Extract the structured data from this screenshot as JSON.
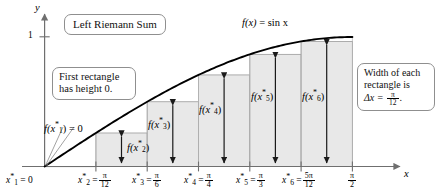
{
  "figure": {
    "title_callout": "Left Riemann Sum",
    "first_rect_callout_line1": "First rectangle",
    "first_rect_callout_line2": "has height 0.",
    "width_callout_line1": "Width of each",
    "width_callout_line2": "rectangle is",
    "width_callout_line3_lhs": "Δx =",
    "width_callout_frac_num": "π",
    "width_callout_frac_den": "12",
    "width_callout_period": ".",
    "function_label_fx": "f(x)",
    "function_label_eq": "=",
    "function_label_rhs": "sin x",
    "y_axis_label": "y",
    "x_axis_label": "x",
    "y_tick_label": "1",
    "f_x1_label_lhs": "f(x",
    "f_x1_label_star": "*",
    "f_x1_label_sub": "1",
    "f_x1_label_rhs": ") = 0",
    "height_arrow_labels": [
      {
        "lhs": "f(x",
        "sub": "2",
        "rhs": ")"
      },
      {
        "lhs": "f(x",
        "sub": "3",
        "rhs": ")"
      },
      {
        "lhs": "f(x",
        "sub": "4",
        "rhs": ")"
      },
      {
        "lhs": "f(x",
        "sub": "5",
        "rhs": ")"
      },
      {
        "lhs": "f(x",
        "sub": "6",
        "rhs": ")"
      }
    ],
    "x_tick_labels": [
      {
        "lhs": "x",
        "sub": "1",
        "eq": "= 0",
        "num": "",
        "den": ""
      },
      {
        "lhs": "x",
        "sub": "2",
        "eq": "=",
        "num": "π",
        "den": "12"
      },
      {
        "lhs": "x",
        "sub": "3",
        "eq": "=",
        "num": "π",
        "den": "6"
      },
      {
        "lhs": "x",
        "sub": "4",
        "eq": "=",
        "num": "π",
        "den": "4"
      },
      {
        "lhs": "x",
        "sub": "5",
        "eq": "=",
        "num": "π",
        "den": "3"
      },
      {
        "lhs": "x",
        "sub": "6",
        "eq": "=",
        "num": "5π",
        "den": "12"
      }
    ],
    "x_end_tick": {
      "num": "π",
      "den": "2"
    },
    "colors": {
      "rect_fill": "#e8e8e8",
      "rect_stroke": "#9a9a9a",
      "curve": "#000000",
      "axis": "#6f6f6f",
      "callout_border": "#8f8f8f",
      "arrow": "#1a1a1a"
    }
  },
  "chart_data": {
    "type": "area",
    "title": "Left Riemann Sum",
    "function": "f(x) = sin x",
    "xlabel": "x",
    "ylabel": "y",
    "xlim": [
      0,
      1.5708
    ],
    "ylim": [
      0,
      1.15
    ],
    "grid": false,
    "legend": "none",
    "delta_x": "pi/12",
    "n_rectangles": 6,
    "sample_points_labels": [
      "0",
      "pi/12",
      "pi/6",
      "pi/4",
      "pi/3",
      "5pi/12"
    ],
    "sample_points_values": [
      0.0,
      0.2618,
      0.5236,
      0.7854,
      1.0472,
      1.309
    ],
    "rectangle_heights_labels": [
      "f(x1*) = 0",
      "f(x2*)",
      "f(x3*)",
      "f(x4*)",
      "f(x5*)",
      "f(x6*)"
    ],
    "rectangle_heights_values": [
      0.0,
      0.2588,
      0.5,
      0.7071,
      0.866,
      0.9659
    ],
    "curve": {
      "name": "sin x",
      "x": [
        0,
        0.1309,
        0.2618,
        0.3927,
        0.5236,
        0.6545,
        0.7854,
        0.9163,
        1.0472,
        1.1781,
        1.309,
        1.4399,
        1.5708
      ],
      "y": [
        0,
        0.1305,
        0.2588,
        0.3827,
        0.5,
        0.6088,
        0.7071,
        0.7934,
        0.866,
        0.9239,
        0.9659,
        0.9914,
        1.0
      ]
    },
    "y_ticks": [
      1
    ],
    "x_ticks_values": [
      0,
      0.2618,
      0.5236,
      0.7854,
      1.0472,
      1.309,
      1.5708
    ],
    "x_ticks_labels": [
      "0",
      "pi/12",
      "pi/6",
      "pi/4",
      "pi/3",
      "5pi/12",
      "pi/2"
    ]
  }
}
